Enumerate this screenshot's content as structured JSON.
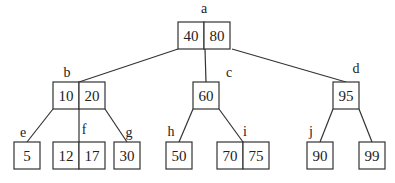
{
  "diagram": {
    "type": "b-tree",
    "nodes": [
      {
        "id": "a",
        "label": "a",
        "keys": [
          "40",
          "80"
        ],
        "x": 178,
        "y": 22,
        "labelPos": [
          204,
          13
        ]
      },
      {
        "id": "b",
        "label": "b",
        "keys": [
          "10",
          "20"
        ],
        "x": 53,
        "y": 82,
        "labelPos": [
          67,
          77
        ]
      },
      {
        "id": "c",
        "label": "c",
        "keys": [
          "60"
        ],
        "x": 193,
        "y": 82,
        "labelPos": [
          229,
          77
        ]
      },
      {
        "id": "d",
        "label": "d",
        "keys": [
          "95"
        ],
        "x": 333,
        "y": 82,
        "labelPos": [
          356,
          73
        ]
      },
      {
        "id": "e",
        "label": "e",
        "keys": [
          "5"
        ],
        "x": 14,
        "y": 142,
        "labelPos": [
          23,
          137
        ]
      },
      {
        "id": "f",
        "label": "f",
        "keys": [
          "12",
          "17"
        ],
        "x": 53,
        "y": 142,
        "labelPos": [
          84,
          134
        ]
      },
      {
        "id": "g",
        "label": "g",
        "keys": [
          "30"
        ],
        "x": 114,
        "y": 142,
        "labelPos": [
          129,
          137
        ]
      },
      {
        "id": "h",
        "label": "h",
        "keys": [
          "50"
        ],
        "x": 166,
        "y": 142,
        "labelPos": [
          171,
          136
        ]
      },
      {
        "id": "i",
        "label": "i",
        "keys": [
          "70",
          "75"
        ],
        "x": 217,
        "y": 142,
        "labelPos": [
          245,
          136
        ]
      },
      {
        "id": "j",
        "label": "j",
        "keys": [
          "90"
        ],
        "x": 307,
        "y": 142,
        "labelPos": [
          311,
          136
        ]
      },
      {
        "id": "k",
        "label": "",
        "keys": [
          "99"
        ],
        "x": 359,
        "y": 142,
        "labelPos": [
          0,
          0
        ]
      }
    ],
    "edges": [
      {
        "from": "a",
        "to": "b",
        "x1": 178,
        "y1": 49,
        "x2": 79,
        "y2": 82
      },
      {
        "from": "a",
        "to": "c",
        "x1": 205,
        "y1": 49,
        "x2": 206,
        "y2": 82
      },
      {
        "from": "a",
        "to": "d",
        "x1": 232,
        "y1": 49,
        "x2": 346,
        "y2": 82
      },
      {
        "from": "b",
        "to": "e",
        "x1": 53,
        "y1": 109,
        "x2": 27,
        "y2": 142
      },
      {
        "from": "b",
        "to": "f",
        "x1": 79,
        "y1": 109,
        "x2": 79,
        "y2": 142
      },
      {
        "from": "b",
        "to": "g",
        "x1": 105,
        "y1": 109,
        "x2": 127,
        "y2": 142
      },
      {
        "from": "c",
        "to": "h",
        "x1": 193,
        "y1": 109,
        "x2": 179,
        "y2": 142
      },
      {
        "from": "c",
        "to": "i",
        "x1": 219,
        "y1": 109,
        "x2": 243,
        "y2": 142
      },
      {
        "from": "d",
        "to": "j",
        "x1": 333,
        "y1": 109,
        "x2": 320,
        "y2": 142
      },
      {
        "from": "d",
        "to": "k",
        "x1": 359,
        "y1": 109,
        "x2": 372,
        "y2": 142
      }
    ],
    "cell_width": 26,
    "cell_height": 27
  }
}
